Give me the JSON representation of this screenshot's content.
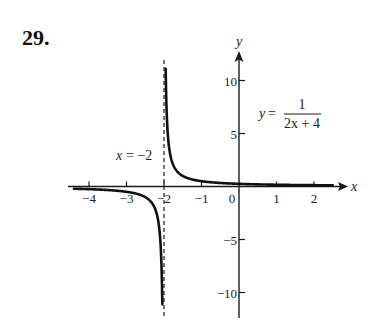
{
  "problem": {
    "number": "29."
  },
  "chart_data": {
    "type": "line",
    "title": "",
    "function": "y = 1/(2x + 4)",
    "xlabel": "x",
    "ylabel": "y",
    "xlim": [
      -4.5,
      2.8
    ],
    "ylim": [
      -12.5,
      12.5
    ],
    "x_ticks": [
      -4,
      -3,
      -2,
      -1,
      0,
      1,
      2
    ],
    "x_tick_labels": [
      "−4",
      "−3",
      "−2",
      "−1",
      "0",
      "1",
      "2"
    ],
    "y_ticks": [
      10,
      5,
      -5,
      -10
    ],
    "y_tick_labels": [
      "10",
      "5",
      "−5",
      "−10"
    ],
    "grid": false,
    "legend": null,
    "vertical_asymptote": {
      "x": -2,
      "label": "x = −2",
      "style": "dashed"
    },
    "horizontal_asymptote": {
      "y": 0
    },
    "series": [
      {
        "name": "right branch",
        "x": [
          -1.955,
          -1.95,
          -1.9,
          -1.8,
          -1.7,
          -1.5,
          -1.25,
          -1,
          -0.5,
          0,
          0.5,
          1,
          1.5,
          2,
          2.5
        ],
        "y": [
          11.1,
          10.0,
          5.0,
          2.5,
          1.667,
          1.0,
          0.667,
          0.5,
          0.333,
          0.25,
          0.2,
          0.167,
          0.143,
          0.125,
          0.111
        ]
      },
      {
        "name": "left branch",
        "x": [
          -4.4,
          -4,
          -3.5,
          -3,
          -2.75,
          -2.5,
          -2.3,
          -2.2,
          -2.1,
          -2.05,
          -2.045
        ],
        "y": [
          -0.208,
          -0.25,
          -0.333,
          -0.5,
          -0.667,
          -1.0,
          -1.667,
          -2.5,
          -5.0,
          -10.0,
          -11.1
        ]
      }
    ],
    "annotations": [
      {
        "text_lhs": "y =",
        "numerator": "1",
        "denominator": "2x + 4",
        "position": "upper right of y-axis"
      },
      {
        "text": "x = −2",
        "position": "left of asymptote near x-axis"
      }
    ]
  },
  "labels": {
    "x_axis": "x",
    "y_axis": "y",
    "asymptote_lhs": "x",
    "asymptote_rhs": "= −2",
    "eq_lhs": "y",
    "eq_eq": "=",
    "eq_num": "1",
    "eq_den": "2x + 4"
  },
  "style": {
    "ink": "#1a1a1a",
    "curve_color": "#111111",
    "background": "#ffffff"
  }
}
